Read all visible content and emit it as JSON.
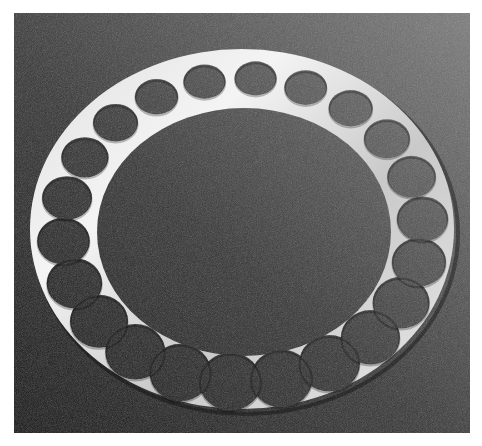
{
  "image": {
    "subject": "Circular metal ring with round cut-out holes on a dark textured surface",
    "hole_count": 22,
    "colors": {
      "background_dark": "#1c1c1c",
      "background_light": "#6e6e6e",
      "metal_light": "#f2f2f2",
      "metal_mid": "#c8c8c8",
      "margin": "#ffffff"
    }
  }
}
